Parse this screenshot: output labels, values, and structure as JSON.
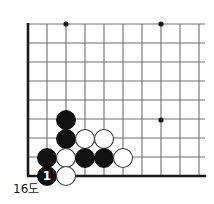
{
  "figure": {
    "caption": "16도",
    "kind": "go-diagram"
  },
  "board": {
    "style": {
      "line_color": "#6e6e6e",
      "edge_color": "#1a1a1a",
      "star_color": "#1a1a1a",
      "black_fill": "#111111",
      "black_stroke": "#000000",
      "white_fill": "#ffffff",
      "white_stroke": "#3a3a3a",
      "background": "#ffffff"
    },
    "geometry": {
      "origin_x": 28,
      "origin_y": 24,
      "spacing": 19,
      "cols": 10,
      "rows": 9,
      "stone_radius": 9.5,
      "left_edge_x": 28,
      "bottom_edge_y": 176,
      "right_extent_x": 205,
      "top_extent_y": 24
    },
    "star_points": [
      {
        "x": 66,
        "y": 24
      },
      {
        "x": 161,
        "y": 24
      },
      {
        "x": 161,
        "y": 120
      }
    ],
    "stones": [
      {
        "color": "black",
        "x": 66,
        "y": 120,
        "label": ""
      },
      {
        "color": "black",
        "x": 66,
        "y": 139,
        "label": ""
      },
      {
        "color": "white",
        "x": 85,
        "y": 139,
        "label": ""
      },
      {
        "color": "white",
        "x": 104,
        "y": 139,
        "label": ""
      },
      {
        "color": "black",
        "x": 47,
        "y": 158,
        "label": ""
      },
      {
        "color": "white",
        "x": 66,
        "y": 158,
        "label": ""
      },
      {
        "color": "black",
        "x": 85,
        "y": 158,
        "label": ""
      },
      {
        "color": "black",
        "x": 104,
        "y": 158,
        "label": ""
      },
      {
        "color": "white",
        "x": 123,
        "y": 158,
        "label": ""
      },
      {
        "color": "black",
        "x": 47,
        "y": 176,
        "label": "1"
      },
      {
        "color": "white",
        "x": 66,
        "y": 176,
        "label": ""
      }
    ]
  }
}
